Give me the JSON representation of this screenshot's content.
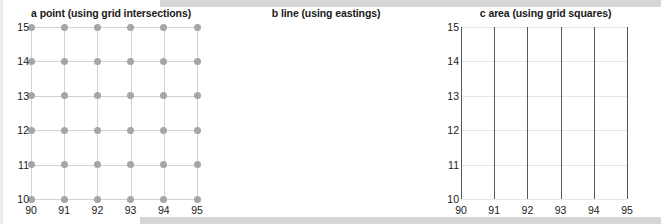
{
  "figure": {
    "panels": [
      {
        "key": "a",
        "letter": "a",
        "title": "point (using grid intersections)",
        "full_title": "a  point (using grid intersections)"
      },
      {
        "key": "b",
        "letter": "b",
        "title": "line (using eastings)",
        "full_title": "b  line (using eastings)"
      },
      {
        "key": "c",
        "letter": "c",
        "title": "area (using grid squares)",
        "full_title": "c  area (using grid squares)"
      }
    ]
  },
  "axes": {
    "x_ticks": [
      "90",
      "91",
      "92",
      "93",
      "94",
      "95"
    ],
    "y_ticks": [
      "15",
      "14",
      "13",
      "12",
      "11",
      "10"
    ],
    "x_min": 90,
    "x_max": 95,
    "y_min": 10,
    "y_max": 15
  },
  "colors": {
    "point_marker": "#a6a6a6",
    "grid_light": "#dcdcdc",
    "line_dark": "#575757",
    "cell_shaded": "#d9d9d9",
    "text": "#1a1a1a",
    "background": "#ffffff"
  },
  "chart_data": [
    {
      "type": "scatter",
      "title": "a  point (using grid intersections)",
      "xlabel": "",
      "ylabel": "",
      "xlim": [
        90,
        95
      ],
      "ylim": [
        10,
        15
      ],
      "grid": true,
      "legend": "none",
      "marker": "filled-circle",
      "description": "Grey dots placed at every grid intersection of the 90-95 easting by 10-15 northing grid.",
      "x": [
        90,
        91,
        92,
        93,
        94,
        95,
        90,
        91,
        92,
        93,
        94,
        95,
        90,
        91,
        92,
        93,
        94,
        95,
        90,
        91,
        92,
        93,
        94,
        95,
        90,
        91,
        92,
        93,
        94,
        95,
        90,
        91,
        92,
        93,
        94,
        95
      ],
      "y": [
        15,
        15,
        15,
        15,
        15,
        15,
        14,
        14,
        14,
        14,
        14,
        14,
        13,
        13,
        13,
        13,
        13,
        13,
        12,
        12,
        12,
        12,
        12,
        12,
        11,
        11,
        11,
        11,
        11,
        11,
        10,
        10,
        10,
        10,
        10,
        10
      ]
    },
    {
      "type": "line",
      "title": "b  line (using eastings)",
      "xlabel": "",
      "ylabel": "",
      "xlim": [
        90,
        95
      ],
      "ylim": [
        10,
        15
      ],
      "grid": true,
      "legend": "none",
      "description": "Dark vertical lines drawn along each easting from northing 10 to 15.",
      "series": [
        {
          "name": "easting 90",
          "x": [
            90,
            90
          ],
          "y": [
            10,
            15
          ]
        },
        {
          "name": "easting 91",
          "x": [
            91,
            91
          ],
          "y": [
            10,
            15
          ]
        },
        {
          "name": "easting 92",
          "x": [
            92,
            92
          ],
          "y": [
            10,
            15
          ]
        },
        {
          "name": "easting 93",
          "x": [
            93,
            93
          ],
          "y": [
            10,
            15
          ]
        },
        {
          "name": "easting 94",
          "x": [
            94,
            94
          ],
          "y": [
            10,
            15
          ]
        },
        {
          "name": "easting 95",
          "x": [
            95,
            95
          ],
          "y": [
            10,
            15
          ]
        }
      ]
    },
    {
      "type": "heatmap",
      "title": "c  area (using grid squares)",
      "xlabel": "",
      "ylabel": "",
      "xlim": [
        90,
        95
      ],
      "ylim": [
        10,
        15
      ],
      "grid": true,
      "legend": "none",
      "description": "Shaded 1x1 grid squares identified by the easting/northing of their lower-left corner.",
      "shaded_cells": [
        {
          "easting": 92,
          "northing": 14
        },
        {
          "easting": 93,
          "northing": 13
        },
        {
          "easting": 90,
          "northing": 12
        },
        {
          "easting": 94,
          "northing": 12
        },
        {
          "easting": 91,
          "northing": 11
        },
        {
          "easting": 92,
          "northing": 10
        }
      ]
    }
  ]
}
